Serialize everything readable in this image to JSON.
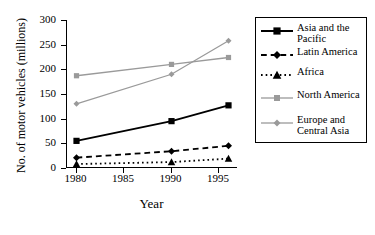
{
  "chart_data": {
    "type": "line",
    "title": "",
    "xlabel": "Year",
    "ylabel": "No. of motor vehicles (millions)",
    "x": [
      1980,
      1990,
      1996
    ],
    "xlim": [
      1979,
      1997
    ],
    "ylim": [
      0,
      300
    ],
    "xticks": [
      "1980",
      "1985",
      "1990",
      "1995"
    ],
    "xtick_values": [
      1980,
      1985,
      1990,
      1995
    ],
    "yticks": [
      "0",
      "50",
      "100",
      "150",
      "200",
      "250",
      "300"
    ],
    "ytick_values": [
      0,
      50,
      100,
      150,
      200,
      250,
      300
    ],
    "grid": false,
    "legend_position": "right",
    "series": [
      {
        "name": "Asia and the Pacific",
        "values": [
          55,
          95,
          127
        ],
        "color": "#000000",
        "line_style": "solid",
        "marker": "square",
        "line_width": 2
      },
      {
        "name": "Latin America",
        "values": [
          21,
          34,
          45
        ],
        "color": "#000000",
        "line_style": "dashed",
        "marker": "diamond",
        "line_width": 1.8
      },
      {
        "name": "Africa",
        "values": [
          8,
          12,
          19
        ],
        "color": "#000000",
        "line_style": "dotted",
        "marker": "triangle",
        "line_width": 1.8
      },
      {
        "name": "North America",
        "values": [
          187,
          210,
          224
        ],
        "color": "#9a9a9a",
        "line_style": "solid",
        "marker": "square",
        "line_width": 1.3
      },
      {
        "name": "Europe and Central Asia",
        "values": [
          130,
          190,
          258
        ],
        "color": "#9a9a9a",
        "line_style": "solid",
        "marker": "diamond",
        "line_width": 1.3
      }
    ]
  },
  "legend": {
    "entries": [
      {
        "label_line1": "Asia and the",
        "label_line2": "Pacific"
      },
      {
        "label_line1": "Latin America",
        "label_line2": ""
      },
      {
        "label_line1": "Africa",
        "label_line2": ""
      },
      {
        "label_line1": "North America",
        "label_line2": ""
      },
      {
        "label_line1": "Europe and",
        "label_line2": "Central Asia"
      }
    ]
  }
}
